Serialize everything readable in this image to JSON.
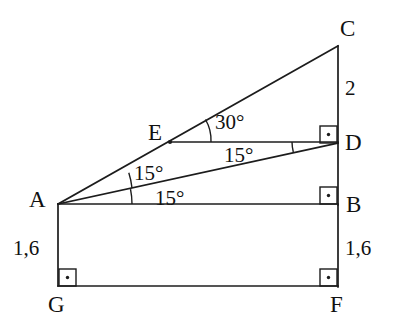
{
  "figure": {
    "kind": "geometry-diagram",
    "background_color": "#ffffff",
    "stroke_color": "#1c1c1c"
  },
  "points": {
    "A": {
      "label": "A"
    },
    "B": {
      "label": "B"
    },
    "C": {
      "label": "C"
    },
    "D": {
      "label": "D"
    },
    "E": {
      "label": "E"
    },
    "F": {
      "label": "F"
    },
    "G": {
      "label": "G"
    }
  },
  "angles": {
    "at_E_CED": "30°",
    "at_A_upper_EAD": "15°",
    "at_A_lower_DAB": "15°",
    "at_D_ADE": "15°"
  },
  "lengths": {
    "CD": "2",
    "AG": "1,6",
    "BF": "1,6"
  },
  "right_angles": {
    "at_D": "right-angle-mark",
    "at_B": "right-angle-mark",
    "at_G": "right-angle-mark",
    "at_F": "right-angle-mark"
  }
}
